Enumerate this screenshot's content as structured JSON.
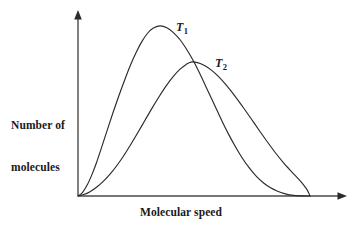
{
  "chart_data": {
    "type": "line",
    "title": "",
    "subtitle": "",
    "xlabel": "Molecular speed",
    "ylabel": "Number of molecules",
    "ylabel_lines": [
      "Number of",
      "molecules"
    ],
    "grid": false,
    "legend_position": "inline-annotation",
    "axis_ticks": false,
    "tick_labels": {
      "x": [],
      "y": []
    },
    "xlim": [
      0,
      1
    ],
    "ylim": [
      0,
      1
    ],
    "annotations": [
      {
        "name": "T1",
        "base": "T",
        "subscript": "1",
        "text": "T1",
        "x": 0.38,
        "y": 0.95
      },
      {
        "name": "T2",
        "base": "T",
        "subscript": "2",
        "text": "T2",
        "x": 0.52,
        "y": 0.73
      }
    ],
    "series": [
      {
        "name": "T1",
        "label": "T1",
        "color": "#2b2b2b",
        "description": "Maxwell-Boltzmann distribution at lower temperature T1: taller, narrower peak",
        "peak": {
          "x": 0.355,
          "y": 0.915
        },
        "points": [
          [
            0.0,
            0.0
          ],
          [
            0.02,
            0.02
          ],
          [
            0.04,
            0.06
          ],
          [
            0.06,
            0.115
          ],
          [
            0.08,
            0.18
          ],
          [
            0.1,
            0.255
          ],
          [
            0.125,
            0.35
          ],
          [
            0.15,
            0.445
          ],
          [
            0.175,
            0.535
          ],
          [
            0.2,
            0.62
          ],
          [
            0.225,
            0.7
          ],
          [
            0.25,
            0.77
          ],
          [
            0.275,
            0.83
          ],
          [
            0.3,
            0.875
          ],
          [
            0.325,
            0.903
          ],
          [
            0.355,
            0.915
          ],
          [
            0.385,
            0.903
          ],
          [
            0.41,
            0.88
          ],
          [
            0.44,
            0.84
          ],
          [
            0.47,
            0.785
          ],
          [
            0.5,
            0.72
          ],
          [
            0.53,
            0.645
          ],
          [
            0.56,
            0.565
          ],
          [
            0.59,
            0.485
          ],
          [
            0.62,
            0.405
          ],
          [
            0.65,
            0.33
          ],
          [
            0.68,
            0.262
          ],
          [
            0.71,
            0.2
          ],
          [
            0.74,
            0.148
          ],
          [
            0.77,
            0.104
          ],
          [
            0.8,
            0.07
          ],
          [
            0.83,
            0.044
          ],
          [
            0.86,
            0.026
          ],
          [
            0.89,
            0.013
          ],
          [
            0.92,
            0.005
          ],
          [
            0.96,
            0.001
          ],
          [
            1.0,
            0.0
          ]
        ]
      },
      {
        "name": "T2",
        "label": "T2",
        "color": "#2b2b2b",
        "description": "Maxwell-Boltzmann distribution at higher temperature T2: lower, broader peak shifted to higher speed",
        "peak": {
          "x": 0.487,
          "y": 0.72
        },
        "points": [
          [
            0.0,
            0.0
          ],
          [
            0.025,
            0.008
          ],
          [
            0.05,
            0.022
          ],
          [
            0.08,
            0.047
          ],
          [
            0.11,
            0.08
          ],
          [
            0.14,
            0.12
          ],
          [
            0.17,
            0.168
          ],
          [
            0.2,
            0.222
          ],
          [
            0.23,
            0.282
          ],
          [
            0.26,
            0.345
          ],
          [
            0.29,
            0.41
          ],
          [
            0.32,
            0.474
          ],
          [
            0.35,
            0.535
          ],
          [
            0.38,
            0.592
          ],
          [
            0.41,
            0.642
          ],
          [
            0.44,
            0.682
          ],
          [
            0.465,
            0.706
          ],
          [
            0.487,
            0.72
          ],
          [
            0.515,
            0.717
          ],
          [
            0.545,
            0.702
          ],
          [
            0.575,
            0.677
          ],
          [
            0.605,
            0.643
          ],
          [
            0.64,
            0.595
          ],
          [
            0.675,
            0.54
          ],
          [
            0.71,
            0.48
          ],
          [
            0.745,
            0.418
          ],
          [
            0.78,
            0.355
          ],
          [
            0.815,
            0.293
          ],
          [
            0.85,
            0.234
          ],
          [
            0.885,
            0.18
          ],
          [
            0.91,
            0.145
          ],
          [
            0.935,
            0.112
          ],
          [
            0.955,
            0.085
          ],
          [
            0.972,
            0.06
          ],
          [
            0.985,
            0.038
          ],
          [
            0.994,
            0.018
          ],
          [
            1.0,
            0.0
          ]
        ]
      }
    ]
  },
  "axes": {
    "x_axis_name": "x-axis",
    "y_axis_name": "y-axis",
    "arrowheads": true,
    "color": "#4a4a4a"
  },
  "labels": {
    "y_line_1": "Number of",
    "y_line_2": "molecules",
    "x_label": "Molecular speed",
    "t1_base": "T",
    "t1_sub": "1",
    "t2_base": "T",
    "t2_sub": "2"
  }
}
